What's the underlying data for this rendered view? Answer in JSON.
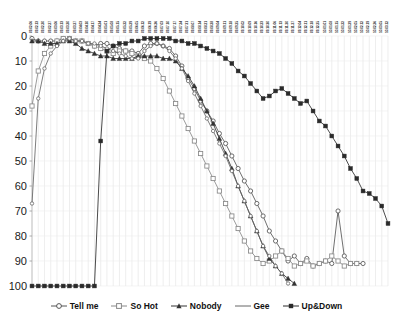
{
  "chart_data": {
    "type": "line",
    "title": "",
    "xlabel": "",
    "ylabel": "",
    "ylim": [
      0,
      100
    ],
    "y_inverted": true,
    "yticks": [
      0,
      10,
      20,
      30,
      40,
      50,
      60,
      70,
      80,
      90,
      100
    ],
    "grid": "vertical-only",
    "legend_position": "bottom",
    "x": [
      "1",
      "2",
      "3",
      "4",
      "5",
      "6",
      "7",
      "8",
      "9",
      "10",
      "11",
      "12",
      "13",
      "14",
      "15",
      "16",
      "17",
      "18",
      "19",
      "20",
      "21",
      "22",
      "23",
      "24",
      "25",
      "26",
      "27",
      "28",
      "29",
      "30",
      "31",
      "32",
      "33",
      "34",
      "35",
      "36",
      "37",
      "38",
      "39",
      "40",
      "41",
      "42",
      "43",
      "44",
      "45",
      "46",
      "47",
      "48",
      "49",
      "50",
      "51",
      "52",
      "53",
      "54",
      "55",
      "56",
      "57",
      "58"
    ],
    "xtick_labels": [
      "09.02.06",
      "09.02.13",
      "09.02.20",
      "09.02.27",
      "09.03.06",
      "09.03.13",
      "09.03.20",
      "09.03.27",
      "09.04.03",
      "09.04.10",
      "09.04.17",
      "09.04.24",
      "09.05.01",
      "09.05.08",
      "09.05.15",
      "09.05.22",
      "09.05.29",
      "09.06.05",
      "09.06.12",
      "09.06.19",
      "09.06.26",
      "09.07.03",
      "09.07.10",
      "09.07.17",
      "09.07.24",
      "09.07.31",
      "09.08.07",
      "09.08.14",
      "09.08.21",
      "09.08.28",
      "09.09.04",
      "09.09.11",
      "09.09.18",
      "09.09.25",
      "09.10.02",
      "09.10.09",
      "09.10.16",
      "09.10.23",
      "09.10.30",
      "09.11.06",
      "09.11.13",
      "09.11.20",
      "09.11.27",
      "09.12.04",
      "09.12.11",
      "09.12.18",
      "09.12.25",
      "10.01.01",
      "10.01.08",
      "10.01.15",
      "10.01.22",
      "10.01.29",
      "10.02.05",
      "10.02.12",
      "10.02.19",
      "10.02.26",
      "10.03.05",
      "10.03.12"
    ],
    "series": [
      {
        "name": "Tell me",
        "marker": "open-circle",
        "color": "#555555",
        "values": [
          1,
          2,
          2,
          2,
          2,
          1,
          1,
          2,
          2,
          3,
          4,
          3,
          3,
          4,
          5,
          6,
          6,
          7,
          4,
          3,
          3,
          4,
          5,
          8,
          12,
          17,
          21,
          26,
          30,
          34,
          39,
          43,
          48,
          53,
          58,
          62,
          67,
          72,
          78,
          82,
          86,
          90,
          88,
          91,
          89,
          92,
          91,
          90,
          91,
          70,
          88,
          91,
          91,
          91,
          null,
          null,
          null,
          null
        ]
      },
      {
        "name": "So Hot",
        "marker": "open-square",
        "color": "#888888",
        "values": [
          28,
          14,
          7,
          4,
          2,
          1,
          1,
          2,
          2,
          3,
          4,
          5,
          6,
          7,
          6,
          6,
          7,
          8,
          9,
          10,
          13,
          17,
          22,
          27,
          32,
          37,
          42,
          47,
          52,
          57,
          62,
          67,
          72,
          77,
          82,
          86,
          89,
          91,
          90,
          88,
          86,
          89,
          92,
          91,
          90,
          92,
          91,
          90,
          88,
          90,
          92,
          91,
          91,
          null,
          null,
          null,
          null,
          null
        ]
      },
      {
        "name": "Nobody",
        "marker": "filled-triangle",
        "color": "#333333",
        "values": [
          2,
          2,
          3,
          3,
          3,
          2,
          2,
          3,
          5,
          6,
          7,
          8,
          8,
          9,
          9,
          9,
          9,
          8,
          8,
          8,
          8,
          9,
          9,
          10,
          13,
          16,
          20,
          25,
          30,
          35,
          41,
          47,
          53,
          60,
          66,
          72,
          78,
          84,
          89,
          92,
          95,
          97,
          99,
          null,
          null,
          null,
          null,
          null,
          null,
          null,
          null,
          null,
          null,
          null,
          null,
          null,
          null,
          null
        ]
      },
      {
        "name": "Gee",
        "marker": "open-circle-small",
        "color": "#666666",
        "values": [
          67,
          25,
          13,
          7,
          4,
          2,
          1,
          2,
          2,
          3,
          3,
          4,
          5,
          6,
          7,
          8,
          9,
          9,
          6,
          4,
          3,
          4,
          6,
          9,
          13,
          18,
          23,
          28,
          33,
          38,
          43,
          48,
          54,
          60,
          66,
          72,
          78,
          84,
          88,
          92,
          95,
          99,
          null,
          null,
          null,
          null,
          null,
          null,
          null,
          null,
          null,
          null,
          null,
          null,
          null,
          null,
          null,
          null
        ]
      },
      {
        "name": "Up&Down",
        "marker": "filled-square",
        "color": "#2a2a2a",
        "values": [
          100,
          100,
          100,
          100,
          100,
          100,
          100,
          100,
          100,
          100,
          100,
          42,
          6,
          4,
          3,
          3,
          2,
          2,
          1,
          1,
          1,
          1,
          1,
          2,
          2,
          3,
          3,
          4,
          5,
          6,
          7,
          9,
          11,
          14,
          16,
          19,
          22,
          25,
          24,
          22,
          21,
          23,
          25,
          27,
          26,
          30,
          34,
          36,
          40,
          44,
          48,
          53,
          57,
          62,
          63,
          65,
          68,
          75
        ]
      }
    ]
  },
  "legend": {
    "items": [
      {
        "label": "Tell me",
        "marker": "open-circle"
      },
      {
        "label": "So Hot",
        "marker": "open-square"
      },
      {
        "label": "Nobody",
        "marker": "filled-triangle"
      },
      {
        "label": "Gee",
        "marker": "plain-line"
      },
      {
        "label": "Up&Down",
        "marker": "filled-square"
      }
    ]
  },
  "axis": {
    "y_values": [
      "0",
      "10",
      "20",
      "30",
      "40",
      "50",
      "60",
      "70",
      "80",
      "90",
      "100"
    ]
  }
}
